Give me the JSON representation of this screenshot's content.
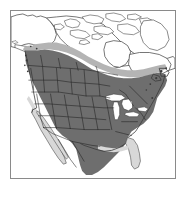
{
  "figure": {
    "alt_text": "Grayscale range map of North America showing breeding and year-round distribution across the contiguous United States and southern Canada",
    "frame": {
      "border_color": "#8a8a8a",
      "background_color": "#ffffff"
    }
  },
  "map": {
    "region_label": "North America",
    "projection_note": "Lambert conformal-style continental outline",
    "colors": {
      "land_unshaded": "#ffffff",
      "range_primary": "#6e6e6e",
      "range_secondary": "#b4b4b4",
      "range_marginal": "#d8d8d8",
      "coastline": "#3a3a3a",
      "political_border": "#1f1f1f",
      "water": "#ffffff",
      "lake": "#ffffff"
    },
    "shading_classes": [
      {
        "id": "range-primary",
        "label": "Primary range",
        "color": "#6e6e6e",
        "coverage": "Contiguous United States, southern and central Canada, northern Mexico"
      },
      {
        "id": "range-secondary",
        "label": "Secondary range",
        "color": "#b4b4b4",
        "coverage": "Northern transition band across central Canada and southeastern Alaska"
      },
      {
        "id": "range-marginal",
        "label": "Marginal range",
        "color": "#d8d8d8",
        "coverage": "Florida peninsula, Baja California, Gulf coastal fringe"
      },
      {
        "id": "outside-range",
        "label": "Outside range",
        "color": "#ffffff",
        "coverage": "Arctic Canada, Canadian Arctic Archipelago, Greenland edge, interior Alaska, southern Mexico"
      }
    ],
    "features": [
      {
        "name": "alaska",
        "label": "Alaska",
        "shaded": "partial"
      },
      {
        "name": "canadian-arctic-archipelago",
        "label": "Canadian Arctic Archipelago",
        "shaded": "none"
      },
      {
        "name": "hudson-bay",
        "label": "Hudson Bay",
        "shaded": "none"
      },
      {
        "name": "great-lakes",
        "label": "Great Lakes",
        "shaded": "none"
      },
      {
        "name": "baja-california",
        "label": "Baja California",
        "shaded": "marginal"
      },
      {
        "name": "florida",
        "label": "Florida",
        "shaded": "marginal"
      },
      {
        "name": "contiguous-united-states",
        "label": "Contiguous United States",
        "shaded": "primary"
      },
      {
        "name": "southern-canada",
        "label": "Southern Canada",
        "shaded": "primary"
      },
      {
        "name": "central-canada-band",
        "label": "Central Canada",
        "shaded": "secondary"
      },
      {
        "name": "northern-mexico",
        "label": "Northern Mexico",
        "shaded": "primary"
      },
      {
        "name": "newfoundland",
        "label": "Newfoundland",
        "shaded": "partial"
      },
      {
        "name": "state-boundaries",
        "label": "State and provincial boundaries",
        "shaded": "none"
      }
    ]
  }
}
